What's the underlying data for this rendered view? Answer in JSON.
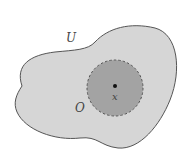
{
  "diagram": {
    "set_label": "U",
    "neighborhood_label": "O",
    "point_label": "x",
    "colors": {
      "set_fill": "#d6d6d6",
      "set_stroke": "#555555",
      "ball_fill": "#a3a3a3",
      "ball_stroke": "#555555",
      "point": "#111111",
      "background": "#ffffff"
    }
  }
}
